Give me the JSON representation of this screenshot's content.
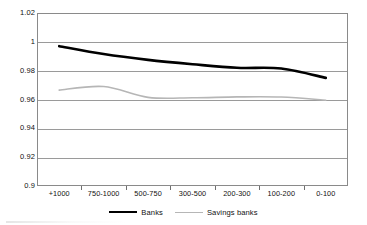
{
  "chart_data": {
    "type": "line",
    "title": "",
    "subtitle": "",
    "xlabel": "",
    "ylabel": "",
    "categories": [
      "+1000",
      "750-1000",
      "500-750",
      "300-500",
      "200-300",
      "100-200",
      "0-100"
    ],
    "ylim": [
      0.9,
      1.02
    ],
    "ytick_labels": [
      "1.02",
      "1",
      "0.98",
      "0.96",
      "0.94",
      "0.92",
      "0.9"
    ],
    "ytick_values": [
      1.02,
      1.0,
      0.98,
      0.96,
      0.94,
      0.92,
      0.9
    ],
    "grid": true,
    "legend_position": "bottom",
    "series": [
      {
        "name": "Banks",
        "color": "#000000",
        "width": 2.6,
        "values": [
          0.997,
          0.9915,
          0.9875,
          0.9845,
          0.982,
          0.9815,
          0.975
        ]
      },
      {
        "name": "Savings banks",
        "color": "#b6b6b6",
        "width": 1.6,
        "values": [
          0.9665,
          0.969,
          0.9615,
          0.9612,
          0.9618,
          0.9617,
          0.9595
        ]
      }
    ]
  },
  "legend": {
    "entries": [
      {
        "label": "Banks",
        "style": "banks"
      },
      {
        "label": "Savings banks",
        "style": "savings"
      }
    ]
  }
}
